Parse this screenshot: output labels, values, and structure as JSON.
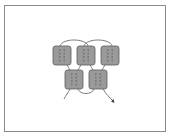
{
  "diagram": {
    "type": "chain-stitch / linked blocks illustration",
    "frame": {
      "x": 4,
      "y": 5,
      "width": 162,
      "height": 127,
      "border_color": "#8a8a8a"
    },
    "colors": {
      "block_fill": "#9a9a9a",
      "block_stroke": "#5c5c5c",
      "thread": "#6e6e6e",
      "dash": "#4a4a4a",
      "arrow": "#3c3c3c"
    },
    "blocks": [
      {
        "id": "top-1",
        "x": 53,
        "y": 46,
        "w": 18,
        "h": 19
      },
      {
        "id": "top-2",
        "x": 77,
        "y": 46,
        "w": 18,
        "h": 19
      },
      {
        "id": "top-3",
        "x": 101,
        "y": 46,
        "w": 18,
        "h": 19
      },
      {
        "id": "bottom-1",
        "x": 65,
        "y": 70,
        "w": 18,
        "h": 19
      },
      {
        "id": "bottom-2",
        "x": 89,
        "y": 70,
        "w": 18,
        "h": 19
      }
    ],
    "connectors": [
      {
        "id": "arc-top-1-2",
        "path": "M60 46 C62 38, 86 38, 88 46"
      },
      {
        "id": "arc-top-2-3",
        "path": "M84 46 C86 38, 110 38, 112 46"
      },
      {
        "id": "link-top1-bottom1",
        "path": "M67 65 C68 67, 69 68, 70 70"
      },
      {
        "id": "link-top2-bottom1",
        "path": "M81 65 C80 67, 79 68, 78 70"
      },
      {
        "id": "link-top2-bottom2",
        "path": "M90 65 C91 67, 92 68, 93 70"
      },
      {
        "id": "link-top3-bottom2",
        "path": "M105 65 C104 67, 103 68, 102 70"
      },
      {
        "id": "arc-bottom-1-2",
        "path": "M78 89 C80 95, 92 95, 94 89"
      },
      {
        "id": "tail-left",
        "path": "M70 89 C68 93, 66 95, 64 99"
      },
      {
        "id": "tail-right",
        "path": "M103 89 C106 94, 109 97, 113 101"
      }
    ],
    "arrow": {
      "x": 113,
      "y": 101,
      "direction": "down-right"
    }
  }
}
